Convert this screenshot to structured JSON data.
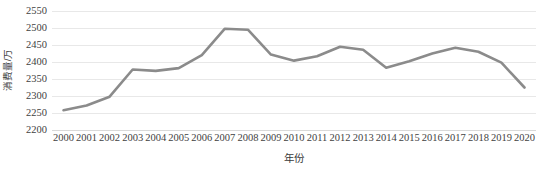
{
  "chart_data": {
    "type": "line",
    "title": "",
    "subtitle": "",
    "xlabel": "年份",
    "ylabel": "消费量/万",
    "categories": [
      "2000",
      "2001",
      "2002",
      "2003",
      "2004",
      "2005",
      "2006",
      "2007",
      "2008",
      "2009",
      "2010",
      "2011",
      "2012",
      "2013",
      "2014",
      "2015",
      "2016",
      "2017",
      "2018",
      "2019",
      "2020"
    ],
    "values": [
      2258,
      2272,
      2298,
      2378,
      2374,
      2382,
      2420,
      2498,
      2495,
      2422,
      2404,
      2417,
      2445,
      2436,
      2383,
      2402,
      2425,
      2442,
      2430,
      2398,
      2325
    ],
    "series": [
      {
        "name": "消费量",
        "values": [
          2258,
          2272,
          2298,
          2378,
          2374,
          2382,
          2420,
          2498,
          2495,
          2422,
          2404,
          2417,
          2445,
          2436,
          2383,
          2402,
          2425,
          2442,
          2430,
          2398,
          2325
        ]
      }
    ],
    "ylim": [
      2200,
      2550
    ],
    "yticks": [
      2200,
      2250,
      2300,
      2350,
      2400,
      2450,
      2500,
      2550
    ],
    "ytick_labels": [
      "2200",
      "2250",
      "2300",
      "2350",
      "2400",
      "2450",
      "2500",
      "2550"
    ],
    "xlim": [
      2000,
      2020
    ],
    "grid": "horizontal",
    "legend": "none",
    "line_color": "#8b8b8b",
    "grid_color": "#e8e8e8",
    "background_color": "#ffffff",
    "markers": false,
    "annotations": []
  }
}
